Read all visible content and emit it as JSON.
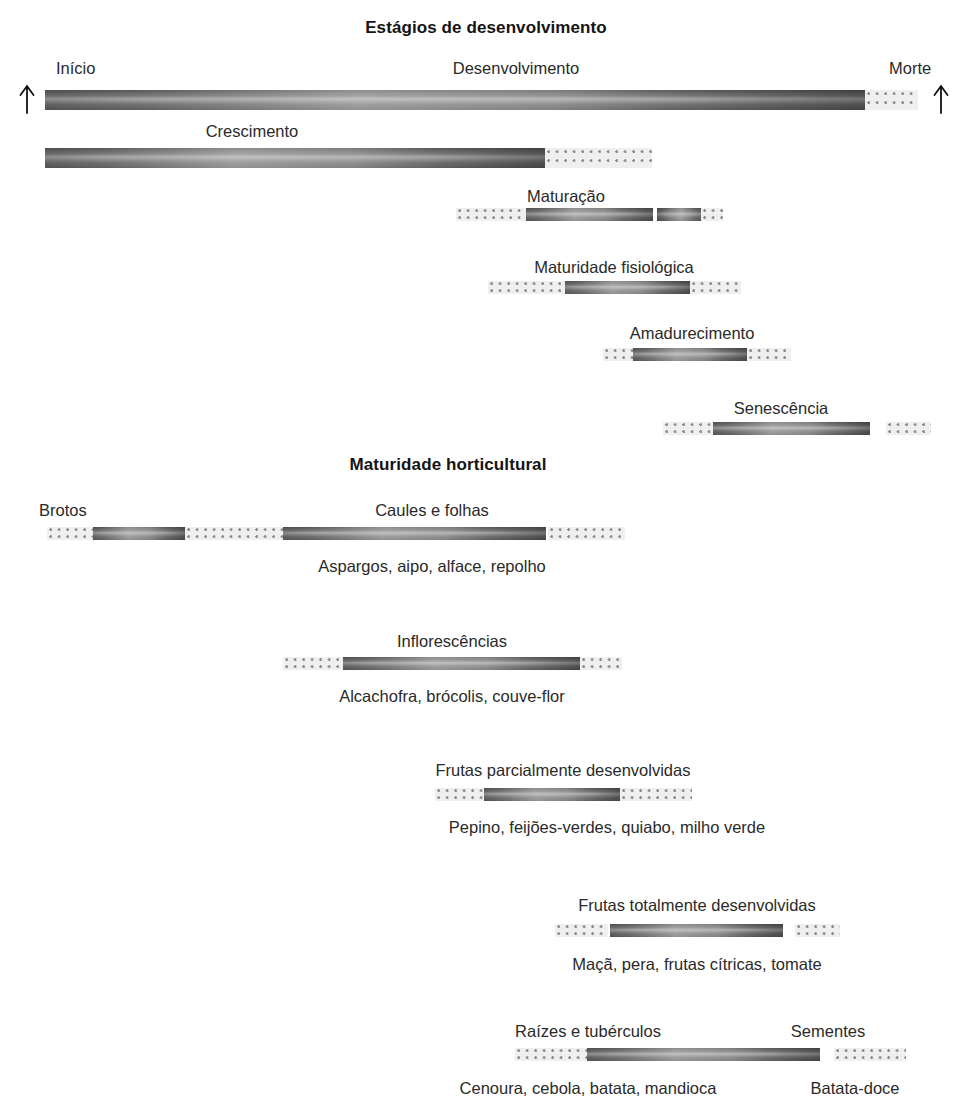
{
  "sections": [
    {
      "id": "estagios",
      "title": "Estágios de desenvolvimento",
      "rows": [
        {
          "labels": [
            "Início",
            "Desenvolvimento",
            "Morte"
          ]
        },
        {
          "labels": [
            "Crescimento"
          ]
        },
        {
          "labels": [
            "Maturação"
          ]
        },
        {
          "labels": [
            "Maturidade fisiológica"
          ]
        },
        {
          "labels": [
            "Amadurecimento"
          ]
        },
        {
          "labels": [
            "Senescência"
          ]
        }
      ]
    },
    {
      "id": "horticultural",
      "title": "Maturidade horticultural",
      "rows": [
        {
          "labels": [
            "Brotos",
            "Caules e folhas"
          ],
          "caption": "Aspargos, aipo, alface, repolho"
        },
        {
          "labels": [
            "Inflorescências"
          ],
          "caption": "Alcachofra, brócolis, couve-flor"
        },
        {
          "labels": [
            "Frutas parcialmente desenvolvidas"
          ],
          "caption": "Pepino, feijões-verdes, quiabo, milho verde"
        },
        {
          "labels": [
            "Frutas totalmente desenvolvidas"
          ],
          "caption": "Maçã, pera, frutas cítricas, tomate"
        },
        {
          "labels": [
            "Raízes e tubérculos",
            "Sementes"
          ],
          "captions": [
            "Cenoura, cebola, batata, mandioca",
            "Batata-doce"
          ]
        }
      ]
    }
  ],
  "titles": {
    "development": "Estágios de desenvolvimento",
    "horticultural": "Maturidade horticultural"
  },
  "labels": {
    "inicio": "Início",
    "desenvolvimento": "Desenvolvimento",
    "morte": "Morte",
    "crescimento": "Crescimento",
    "maturacao": "Maturação",
    "maturidade_fisiologica": "Maturidade fisiológica",
    "amadurecimento": "Amadurecimento",
    "senescencia": "Senescência",
    "brotos": "Brotos",
    "caules_e_folhas": "Caules e folhas",
    "inflorescencias": "Inflorescências",
    "frutas_parciais": "Frutas parcialmente desenvolvidas",
    "frutas_totais": "Frutas totalmente desenvolvidas",
    "raizes_tuberculos": "Raízes e tubérculos",
    "sementes": "Sementes"
  },
  "captions": {
    "caules": "Aspargos, aipo, alface, repolho",
    "inflorescencias": "Alcachofra, brócolis, couve-flor",
    "frutas_parciais": "Pepino, feijões-verdes, quiabo, milho verde",
    "frutas_totais": "Maçã, pera, frutas cítricas, tomate",
    "raizes": "Cenoura, cebola, batata, mandioca",
    "sementes": "Batata-doce"
  },
  "colors": {
    "text": "#2a2a2a",
    "title": "#141414",
    "bar_dark": "#595959",
    "bar_light": "#a8a8a8",
    "dotted_bg": "#efefef",
    "dot": "#8d8d8d",
    "background": "#ffffff"
  },
  "icons": {
    "arrow_left": "up-arrow-icon",
    "arrow_right": "up-arrow-icon"
  }
}
